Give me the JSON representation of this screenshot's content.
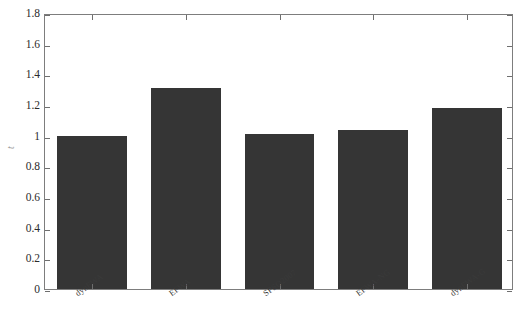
{
  "chart_data": {
    "type": "bar",
    "title": "",
    "subtitle": "",
    "xlabel": "",
    "ylabel": "t",
    "categories": [
      "dynFWA",
      "EFWA",
      "SPSO2007",
      "EFWA-NG",
      "dynFWA-G"
    ],
    "values": [
      1.0,
      1.31,
      1.01,
      1.04,
      1.18
    ],
    "series": [
      {
        "name": "t",
        "values": [
          1.0,
          1.31,
          1.01,
          1.04,
          1.18
        ]
      }
    ],
    "ylim": [
      0,
      1.8
    ],
    "ytick_labels": [
      "0",
      "0.2",
      "0.4",
      "0.6",
      "0.8",
      "1",
      "1.2",
      "1.4",
      "1.6",
      "1.8"
    ],
    "ytick_values": [
      0,
      0.2,
      0.4,
      0.6,
      0.8,
      1.0,
      1.2,
      1.4,
      1.6,
      1.8
    ],
    "grid": false,
    "legend": null,
    "legend_position": "none",
    "bar_color": "#353535",
    "frame_color": "#7d7d7d",
    "background_color": "#ffffff",
    "annotations": []
  },
  "axes": {
    "y_label": "t",
    "y_min_label": "0",
    "y_max_label": "1.8"
  },
  "caption": {
    "text": ""
  }
}
